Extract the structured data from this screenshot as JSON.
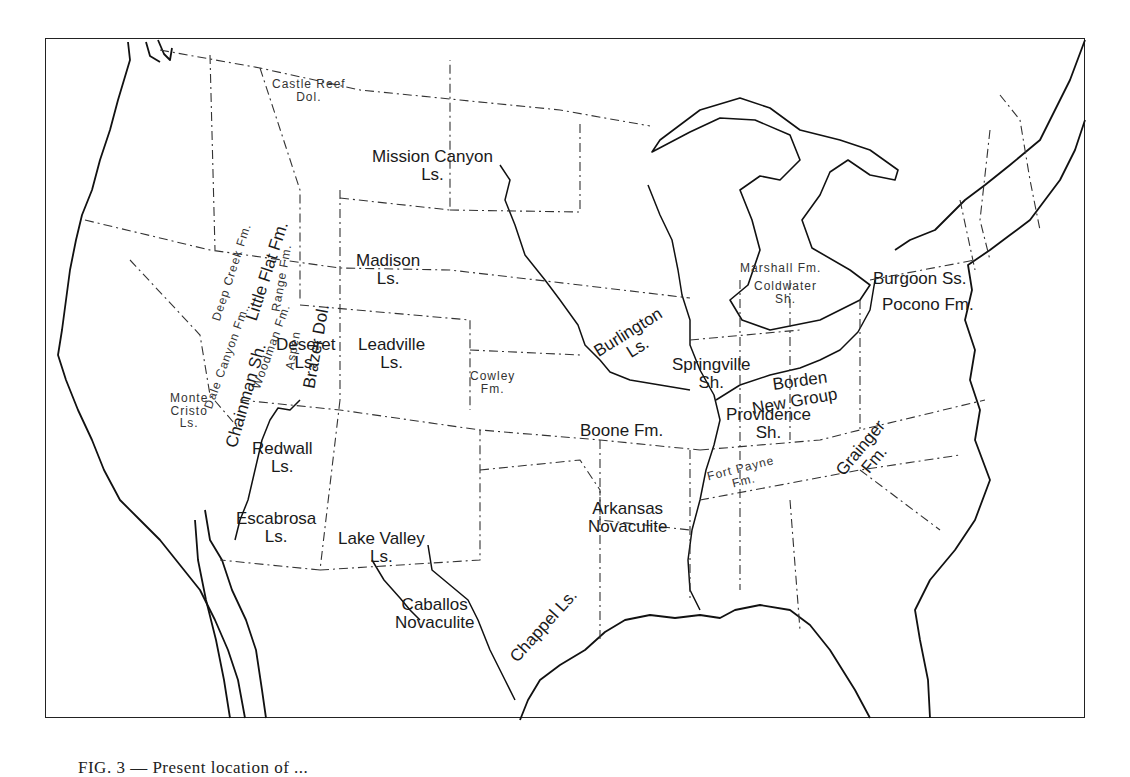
{
  "figure": {
    "caption_partial": "FIG. 3 — Present location of ...",
    "caption_visibility": "cut off at bottom edge"
  },
  "map": {
    "region": "Conterminous United States",
    "line_styles": {
      "coastline_and_rivers": "solid",
      "state_boundaries": "dash-dot"
    },
    "formation_labels": [
      {
        "id": "castle-reef",
        "name": "Castle Reef\nDol."
      },
      {
        "id": "mission-canyon",
        "name": "Mission Canyon\nLs."
      },
      {
        "id": "deep-creek",
        "name": "Deep Creek Fm."
      },
      {
        "id": "little-flat",
        "name": "Little Flat Fm."
      },
      {
        "id": "range-fm",
        "name": "Range Fm."
      },
      {
        "id": "aspen",
        "name": "Aspen"
      },
      {
        "id": "brazer",
        "name": "Brazer Dol."
      },
      {
        "id": "woodman",
        "name": "Woodman Fm."
      },
      {
        "id": "chainman",
        "name": "Chainman Sh."
      },
      {
        "id": "dale-canyon",
        "name": "Dale Canyon Fm."
      },
      {
        "id": "madison",
        "name": "Madison\nLs."
      },
      {
        "id": "deseret",
        "name": "Deseret\nLs."
      },
      {
        "id": "leadville",
        "name": "Leadville\nLs."
      },
      {
        "id": "monte-cristo",
        "name": "Monte\nCristo\nLs."
      },
      {
        "id": "cowley",
        "name": "Cowley\nFm."
      },
      {
        "id": "redwall",
        "name": "Redwall\nLs."
      },
      {
        "id": "escabrosa",
        "name": "Escabrosa\nLs."
      },
      {
        "id": "lake-valley",
        "name": "Lake Valley\nLs."
      },
      {
        "id": "caballos",
        "name": "Caballos\nNovaculite"
      },
      {
        "id": "chappel",
        "name": "Chappel Ls."
      },
      {
        "id": "boone",
        "name": "Boone Fm."
      },
      {
        "id": "arkansas",
        "name": "Arkansas\nNovaculite"
      },
      {
        "id": "burlington",
        "name": "Burlington\nLs."
      },
      {
        "id": "springville",
        "name": "Springville\nSh."
      },
      {
        "id": "borden",
        "name": "Borden"
      },
      {
        "id": "new-group",
        "name": "New Group"
      },
      {
        "id": "providence",
        "name": "Providence\nSh."
      },
      {
        "id": "marshall",
        "name": "Marshall Fm."
      },
      {
        "id": "coldwater",
        "name": "Coldwater\nSh."
      },
      {
        "id": "burgoon",
        "name": "Burgoon Ss."
      },
      {
        "id": "pocono",
        "name": "Pocono Fm."
      },
      {
        "id": "grainger",
        "name": "Grainger\nFm."
      },
      {
        "id": "fort-payne",
        "name": "Fort Payne\nFm."
      }
    ]
  }
}
